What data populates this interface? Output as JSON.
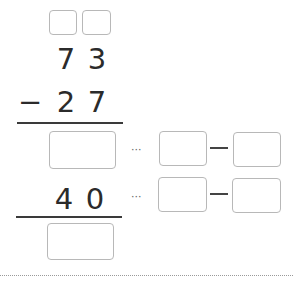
{
  "problem": {
    "type": "vertical subtraction with regrouping",
    "minuend": {
      "tens": "7",
      "ones": "3"
    },
    "subtrahend": {
      "sign": "−",
      "tens": "2",
      "ones": "7"
    },
    "partial": {
      "tens": "4",
      "ones": "0"
    },
    "dots": "···",
    "carry_boxes": [
      "",
      ""
    ],
    "answer_boxes": {
      "step1_result": "",
      "step1_left": "",
      "step1_right": "",
      "step2_left": "",
      "step2_right": "",
      "final_result": ""
    }
  },
  "colors": {
    "box_border": "#b8b8b8",
    "text": "#2b2b2b",
    "rule": "#3a3a3a"
  }
}
